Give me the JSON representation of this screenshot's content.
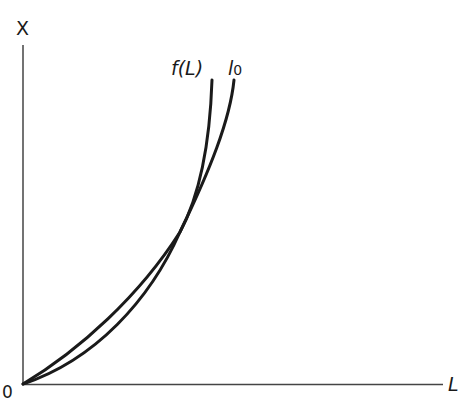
{
  "diagram": {
    "type": "economics-curves",
    "axes": {
      "y_label": "X",
      "x_label": "L",
      "origin_label": "0"
    },
    "curves": [
      {
        "id": "f_L",
        "label": "f(L)",
        "description": "convex curve from origin, above l0 at low L, crosses l0 then rises more steeply"
      },
      {
        "id": "l0",
        "label": "l",
        "label_subscript": "0",
        "description": "convex curve from origin, below f(L) at low L, above after intersection"
      }
    ],
    "intersection": {
      "description": "curves intersect once in the interior"
    },
    "colors": {
      "line": "#1a1a1a",
      "background": "#ffffff"
    }
  }
}
